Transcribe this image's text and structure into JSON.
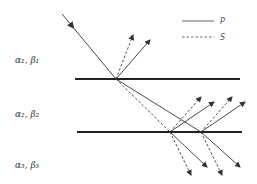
{
  "diagram": {
    "layers": [
      {
        "id": "layer-1",
        "label": "α₁, β₁"
      },
      {
        "id": "layer-2",
        "label": "α₂, β₂"
      },
      {
        "id": "layer-3",
        "label": "α₃, β₃"
      }
    ],
    "legend": [
      {
        "key": "P",
        "label": "P",
        "style": "solid"
      },
      {
        "key": "S",
        "label": "S",
        "style": "dashed"
      }
    ],
    "colors": {
      "ray": "#333333",
      "interface": "#222222",
      "text": "#333333"
    }
  }
}
